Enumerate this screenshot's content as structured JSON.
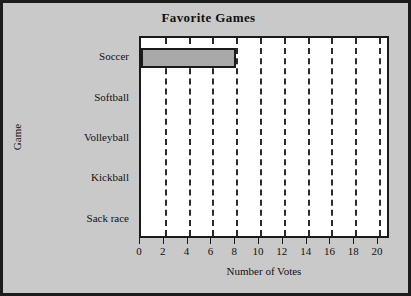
{
  "chart_data": {
    "type": "bar",
    "orientation": "horizontal",
    "title": "Favorite Games",
    "xlabel": "Number of Votes",
    "ylabel": "Game",
    "categories": [
      "Soccer",
      "Softball",
      "Volleyball",
      "Kickball",
      "Sack race"
    ],
    "values": [
      8,
      0,
      0,
      0,
      0
    ],
    "xlim": [
      0,
      21
    ],
    "xticks": [
      0,
      2,
      4,
      6,
      8,
      10,
      12,
      14,
      16,
      18,
      20
    ],
    "xtick_labels": [
      "0",
      "2",
      "4",
      "6",
      "8",
      "10",
      "12",
      "14",
      "16",
      "18",
      "20"
    ],
    "grid": true,
    "grid_axis": "x",
    "grid_style": "dashed",
    "legend": "none",
    "colors": {
      "bar_fill": "#a9a9a9",
      "bar_edge": "#1a1a1a",
      "plot_background": "#ffffff",
      "figure_background": "#c9c9c9",
      "frame": "#1c1c1c",
      "gridline": "#2b2b2b",
      "text": "#111111"
    }
  }
}
